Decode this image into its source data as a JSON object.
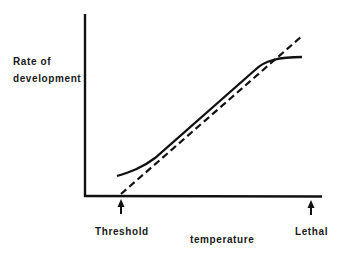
{
  "diagram": {
    "y_axis_label_line1": "Rate of",
    "y_axis_label_line2": "development",
    "x_axis_label": "temperature",
    "markers": [
      {
        "label": "Threshold",
        "icon": "arrow-up-icon"
      },
      {
        "label": "Lethal",
        "icon": "arrow-up-icon"
      }
    ],
    "series": [
      {
        "name": "actual development curve",
        "style": "solid"
      },
      {
        "name": "linear approximation",
        "style": "dashed"
      }
    ],
    "colors": {
      "ink": "#111111",
      "background": "#ffffff"
    }
  }
}
